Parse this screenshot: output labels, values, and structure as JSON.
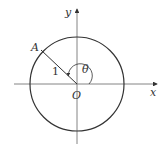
{
  "diagram": {
    "type": "unit-circle",
    "labels": {
      "y_axis": "y",
      "x_axis": "x",
      "origin": "O",
      "point": "A",
      "radius": "1",
      "angle": "θ"
    },
    "colors": {
      "stroke": "#333333",
      "axis": "#555555",
      "background": "#ffffff"
    }
  }
}
